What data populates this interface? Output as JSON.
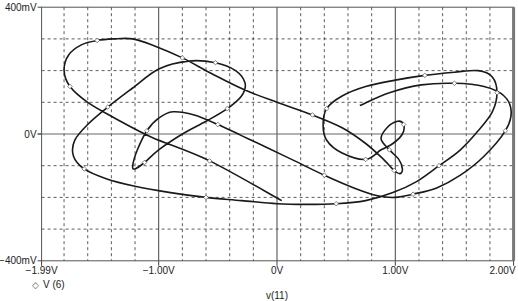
{
  "chart_data": {
    "type": "line",
    "title": "",
    "xlabel": "v(11)",
    "ylabel": "",
    "xlim": [
      -1.99,
      2.0
    ],
    "ylim": [
      -400,
      400
    ],
    "x_unit": "V",
    "y_unit": "mV",
    "grid": true,
    "grid_style": "dashed",
    "x_ticks": [
      {
        "value": -1.99,
        "label": "-1.99V"
      },
      {
        "value": -1.0,
        "label": "-1.00V"
      },
      {
        "value": 0.0,
        "label": "0V"
      },
      {
        "value": 1.0,
        "label": "1.00V"
      },
      {
        "value": 2.0,
        "label": "2.00V"
      }
    ],
    "x_minor_gridlines": [
      -1.8,
      -1.6,
      -1.4,
      -1.2,
      -0.8,
      -0.6,
      -0.4,
      -0.2,
      0.2,
      0.4,
      0.6,
      0.8,
      1.2,
      1.4,
      1.6,
      1.8
    ],
    "y_ticks": [
      {
        "value": 400,
        "label": "400mV"
      },
      {
        "value": 0,
        "label": "0V"
      },
      {
        "value": -400,
        "label": "-400mV"
      }
    ],
    "y_minor_gridlines": [
      300,
      200,
      100,
      -100,
      -200,
      -300
    ],
    "legend": {
      "position": "bottom-left",
      "entries": [
        {
          "marker": "diamond",
          "label": "V (6)"
        }
      ]
    },
    "series": [
      {
        "name": "V (6)",
        "marker": "diamond",
        "color": "#1a1a1a",
        "x": [
          0.04,
          -0.57,
          -1.06,
          -1.37,
          -1.6,
          -1.75,
          -1.8,
          -1.76,
          -1.65,
          -1.52,
          -1.38,
          -1.22,
          -1.05,
          -0.8,
          -0.55,
          -0.28,
          0.0,
          0.3,
          0.55,
          0.75,
          0.9,
          0.99,
          1.04,
          1.06,
          1.03,
          0.95,
          0.88,
          0.93,
          1.02,
          1.07,
          1.06,
          0.98,
          0.88,
          0.75,
          0.55,
          0.42,
          0.39,
          0.42,
          0.55,
          0.75,
          1.0,
          1.25,
          1.5,
          1.7,
          1.82,
          1.86,
          1.82,
          1.7,
          1.55,
          1.37,
          1.18,
          0.98,
          0.75,
          0.5,
          0.25,
          0.0,
          -0.3,
          -0.6,
          -0.9,
          -1.2,
          -1.45,
          -1.63,
          -1.72,
          -1.71,
          -1.6,
          -1.43,
          -1.22,
          -1.0,
          -0.75,
          -0.52,
          -0.35,
          -0.27,
          -0.3,
          -0.42,
          -0.6,
          -0.8,
          -1.0,
          -1.12,
          -1.2,
          -1.22,
          -1.18,
          -1.1,
          -1.0,
          -0.88,
          -0.7,
          -0.5,
          -0.3,
          -0.1,
          0.15,
          0.4,
          0.65,
          0.85,
          1.0,
          1.15,
          1.35,
          1.55,
          1.75,
          1.93,
          1.98,
          1.92,
          1.75,
          1.5,
          1.22,
          0.95,
          0.7
        ],
        "y": [
          -210,
          -85,
          -10,
          50,
          100,
          150,
          200,
          250,
          282,
          295,
          300,
          300,
          280,
          240,
          190,
          140,
          100,
          60,
          20,
          -30,
          -80,
          -115,
          -125,
          -110,
          -80,
          -50,
          -15,
          20,
          40,
          30,
          0,
          -30,
          -50,
          -80,
          -60,
          -20,
          30,
          80,
          120,
          150,
          170,
          185,
          195,
          200,
          180,
          130,
          70,
          10,
          -50,
          -100,
          -150,
          -185,
          -210,
          -220,
          -222,
          -220,
          -210,
          -200,
          -185,
          -165,
          -140,
          -110,
          -70,
          -20,
          30,
          85,
          145,
          205,
          230,
          225,
          200,
          160,
          120,
          80,
          40,
          0,
          -50,
          -90,
          -110,
          -100,
          -50,
          10,
          50,
          70,
          60,
          30,
          -5,
          -40,
          -85,
          -130,
          -170,
          -195,
          -200,
          -190,
          -170,
          -130,
          -70,
          10,
          70,
          120,
          150,
          160,
          155,
          130,
          90
        ]
      }
    ]
  },
  "legend": {
    "marker": "◇",
    "label": "V (6)"
  },
  "axes": {
    "xlabel": "v(11)"
  }
}
